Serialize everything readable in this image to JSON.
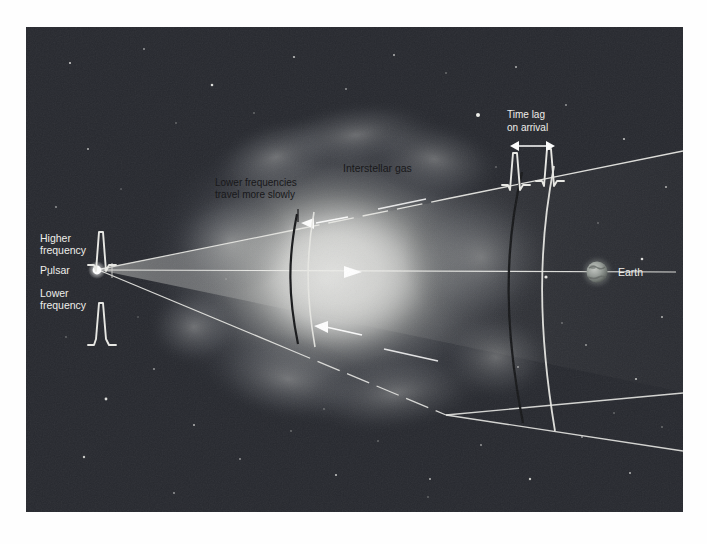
{
  "figure": {
    "background_color": "#2b2e34",
    "page_background": "#fefefe",
    "frame": {
      "x": 26,
      "y": 27,
      "width": 657,
      "height": 485
    }
  },
  "labels": {
    "higher_frequency": "Higher\nfrequency",
    "higher_frequency_line1": "Higher",
    "higher_frequency_line2": "frequency",
    "pulsar": "Pulsar",
    "lower_frequency_line1": "Lower",
    "lower_frequency_line2": "frequency",
    "lower_freq_slow_line1": "Lower frequencies",
    "lower_freq_slow_line2": "travel more slowly",
    "interstellar_gas": "Interstellar gas",
    "time_lag_line1": "Time lag",
    "time_lag_line2": "on arrival",
    "earth": "Earth"
  },
  "colors": {
    "sky": "#2b2e34",
    "sky_deep": "#24262b",
    "nebula_core": "#d9d9d7",
    "nebula_mid": "#9b9c9a",
    "beam_fill": "#b9bab6",
    "line_light": "#e8e8e4",
    "line_dark": "#1a1a1c",
    "star": "#f2f2ee",
    "earth_body": "#8b8f8c",
    "label_dark": "#101012",
    "label_light": "#f0f0ec",
    "pulsar_dot": "#ffffff"
  },
  "objects": {
    "pulsar": {
      "x": 97,
      "y": 270,
      "radius": 5,
      "name": "pulsar-source"
    },
    "earth": {
      "x": 597,
      "y": 272,
      "radius": 11,
      "name": "earth-planet"
    },
    "beam_apex": {
      "x": 99,
      "y": 270
    },
    "beam_top_end": {
      "x": 700,
      "y": 152
    },
    "beam_bottom_end": {
      "x": 700,
      "y": 392
    }
  },
  "wavefronts": [
    {
      "name": "near-dark-arc",
      "x": 296,
      "color": "#17181a",
      "type": "lower-frequency"
    },
    {
      "name": "near-light-arc",
      "x": 312,
      "color": "#e8e8e4",
      "type": "higher-frequency"
    },
    {
      "name": "far-dark-arc",
      "x": 519,
      "color": "#17181a",
      "type": "lower-frequency"
    },
    {
      "name": "far-light-arc",
      "x": 551,
      "color": "#e8e8e4",
      "type": "higher-frequency"
    }
  ],
  "pulse_profiles": [
    {
      "name": "higher-frequency-pulse",
      "x": 104,
      "y": 252,
      "scale": 1.0
    },
    {
      "name": "lower-frequency-pulse",
      "x": 104,
      "y": 313,
      "scale": 1.0
    },
    {
      "name": "arrival-pulse-early",
      "x": 512,
      "y": 178,
      "scale": 0.95
    },
    {
      "name": "arrival-pulse-late",
      "x": 548,
      "y": 178,
      "scale": 0.95
    }
  ],
  "arrows": [
    {
      "name": "propagation-arrow-upper",
      "x": 337,
      "y": 218,
      "direction": "right"
    },
    {
      "name": "propagation-arrow-center",
      "x": 352,
      "y": 271,
      "direction": "right"
    },
    {
      "name": "propagation-arrow-lower",
      "x": 345,
      "y": 325,
      "direction": "right"
    },
    {
      "name": "time-lag-arrow",
      "x1": 505,
      "x2": 551,
      "y": 150,
      "direction": "both"
    }
  ]
}
